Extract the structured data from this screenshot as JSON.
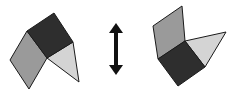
{
  "diagram": {
    "colors": {
      "dark_square": "#2e2e2e",
      "gray_parallelogram": "#9a9a9a",
      "light_triangle": "#d4d4d4",
      "outline": "#1a1a1a",
      "arrow": "#111111"
    },
    "left_figure": {
      "dark_square": "54,13 73,42 47,58 27,31",
      "gray_parallelogram": "27,31 47,58 29,89 10,60",
      "light_triangle": "47,58 73,42 79,82"
    },
    "right_figure": {
      "dark_square": "185,41 205,67 178,86 158,59",
      "gray_parallelogram": "182,6 185,41 158,59 153,26",
      "light_triangle": "185,41 226,32 205,67"
    },
    "arrow": {
      "type": "double-headed-vertical",
      "x": 116,
      "y_top": 23,
      "y_bottom": 75
    }
  }
}
